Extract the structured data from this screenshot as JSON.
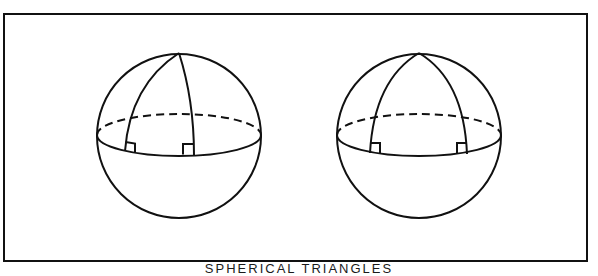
{
  "figure": {
    "caption": "SPHERICAL TRIANGLES",
    "stroke_color": "#111111",
    "background": "#ffffff",
    "frame": {
      "x": 4,
      "y": 14,
      "width": 583,
      "height": 247
    },
    "spheres": [
      {
        "id": "left",
        "center": [
          179,
          136
        ],
        "radius": 82,
        "equator_ry": 21,
        "pole": [
          179,
          53
        ],
        "meridian_feet": [
          [
            125,
            151
          ],
          [
            194,
            155
          ]
        ],
        "right_angle_marks": 2
      },
      {
        "id": "right",
        "center": [
          419,
          136
        ],
        "radius": 82,
        "equator_ry": 21,
        "pole": [
          419,
          53
        ],
        "meridian_feet": [
          [
            370,
            153
          ],
          [
            467,
            154
          ]
        ],
        "right_angle_marks": 2
      }
    ]
  }
}
